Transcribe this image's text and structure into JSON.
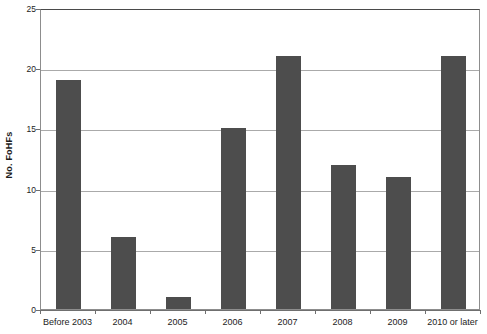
{
  "chart_data": {
    "type": "bar",
    "title": "",
    "subtitle": "",
    "xlabel": "",
    "ylabel": "No. FoHFs",
    "categories": [
      "Before 2003",
      "2004",
      "2005",
      "2006",
      "2007",
      "2008",
      "2009",
      "2010 or later"
    ],
    "values": [
      19,
      6,
      1,
      15,
      21,
      12,
      11,
      21
    ],
    "ylim": [
      0,
      25
    ],
    "ytick_labels": [
      "0",
      "5",
      "10",
      "15",
      "20",
      "25"
    ],
    "ytick_values": [
      0,
      5,
      10,
      15,
      20,
      25
    ],
    "grid": "horizontal",
    "legend": "none",
    "bar_color": "#4d4d4d",
    "gridline_color": "#aaaaaa",
    "axis_color": "#6f6f6f",
    "background_color": "#ffffff"
  }
}
